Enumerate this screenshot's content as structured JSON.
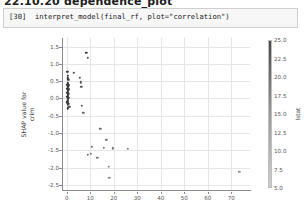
{
  "notebook": {
    "heading": "22.10.20  dependence_plot",
    "cell_prompt": "[30]",
    "cell_code": "interpret_model(final_rf, plot=\"correlation\")"
  },
  "colors": {
    "point_dark": "#3b3b3b",
    "point_mid": "#6e6e6e",
    "point_light": "#a8a8a8",
    "grid": "#e6e6e6",
    "spine": "#8a8a8a",
    "cell_bg": "#f7f7f7",
    "cell_border": "#cfcfcf"
  },
  "chart_data": {
    "type": "scatter",
    "title": "",
    "xlabel": "",
    "ylabel": "SHAP value for\ncrim",
    "ylabel_line1": "SHAP value for",
    "ylabel_line2": "crim",
    "xlim": [
      -2,
      78
    ],
    "ylim": [
      -2.65,
      1.75
    ],
    "grid": true,
    "legend": "none",
    "xticks": [
      0,
      10,
      20,
      30,
      40,
      50,
      60,
      70
    ],
    "xticklabels": [
      "0",
      "10",
      "20",
      "30",
      "40",
      "50",
      "60",
      "70"
    ],
    "yticks": [
      1.5,
      1.0,
      0.5,
      0.0,
      -0.5,
      -1.0,
      -1.5,
      -2.0,
      -2.5
    ],
    "yticklabels": [
      "1.5",
      "1.0",
      "0.5",
      "0.0",
      "-0.5",
      "-1.0",
      "-1.5",
      "-2.0",
      "-2.5"
    ],
    "colorbar": {
      "label": "lstat",
      "ticks": [
        25.0,
        22.5,
        20.0,
        17.5,
        15.0,
        12.5,
        10.0,
        7.5,
        5.0
      ],
      "ticklabels": [
        "25.0",
        "22.5",
        "20.0",
        "17.5",
        "15.0",
        "12.5",
        "10.0",
        "7.5",
        "5.0"
      ],
      "vmin": 5.0,
      "vmax": 25.0,
      "cmap": "grayscale"
    },
    "points": [
      {
        "x": 8.3,
        "y": 1.33,
        "c": 9.0
      },
      {
        "x": 8.9,
        "y": 1.18,
        "c": 10.5
      },
      {
        "x": 0.3,
        "y": 0.78,
        "c": 7.0
      },
      {
        "x": 3.1,
        "y": 0.74,
        "c": 8.5
      },
      {
        "x": 0.5,
        "y": 0.66,
        "c": 6.0
      },
      {
        "x": 5.6,
        "y": 0.6,
        "c": 11.0
      },
      {
        "x": 0.4,
        "y": 0.58,
        "c": 6.5
      },
      {
        "x": 0.6,
        "y": 0.54,
        "c": 7.5
      },
      {
        "x": 5.9,
        "y": 0.47,
        "c": 12.0
      },
      {
        "x": 0.4,
        "y": 0.46,
        "c": 6.2
      },
      {
        "x": 0.5,
        "y": 0.42,
        "c": 6.8
      },
      {
        "x": 0.3,
        "y": 0.4,
        "c": 7.2
      },
      {
        "x": 0.6,
        "y": 0.38,
        "c": 8.0
      },
      {
        "x": 0.4,
        "y": 0.35,
        "c": 6.4
      },
      {
        "x": 6.2,
        "y": 0.33,
        "c": 13.0
      },
      {
        "x": 0.5,
        "y": 0.31,
        "c": 7.8
      },
      {
        "x": 0.3,
        "y": 0.28,
        "c": 6.1
      },
      {
        "x": 0.7,
        "y": 0.26,
        "c": 8.3
      },
      {
        "x": 0.4,
        "y": 0.23,
        "c": 6.9
      },
      {
        "x": 0.5,
        "y": 0.2,
        "c": 7.4
      },
      {
        "x": 0.3,
        "y": 0.17,
        "c": 6.3
      },
      {
        "x": 0.6,
        "y": 0.14,
        "c": 8.8
      },
      {
        "x": 0.4,
        "y": 0.11,
        "c": 7.1
      },
      {
        "x": 0.5,
        "y": 0.07,
        "c": 7.6
      },
      {
        "x": 0.3,
        "y": 0.04,
        "c": 6.6
      },
      {
        "x": 0.6,
        "y": 0.01,
        "c": 8.1
      },
      {
        "x": 0.4,
        "y": -0.03,
        "c": 7.3
      },
      {
        "x": 0.5,
        "y": -0.07,
        "c": 7.9
      },
      {
        "x": 0.3,
        "y": -0.11,
        "c": 6.7
      },
      {
        "x": 0.7,
        "y": -0.15,
        "c": 9.2
      },
      {
        "x": 0.4,
        "y": -0.19,
        "c": 7.7
      },
      {
        "x": 1.1,
        "y": -0.24,
        "c": 9.6
      },
      {
        "x": 6.4,
        "y": -0.22,
        "c": 14.0
      },
      {
        "x": 0.5,
        "y": -0.29,
        "c": 8.4
      },
      {
        "x": 7.0,
        "y": -0.42,
        "c": 15.5
      },
      {
        "x": 14.3,
        "y": -0.88,
        "c": 17.0
      },
      {
        "x": 16.8,
        "y": -1.19,
        "c": 18.0
      },
      {
        "x": 10.6,
        "y": -1.4,
        "c": 16.5
      },
      {
        "x": 15.7,
        "y": -1.42,
        "c": 19.0
      },
      {
        "x": 19.5,
        "y": -1.44,
        "c": 20.0
      },
      {
        "x": 25.9,
        "y": -1.46,
        "c": 21.0
      },
      {
        "x": 9.0,
        "y": -1.63,
        "c": 17.5
      },
      {
        "x": 10.2,
        "y": -1.6,
        "c": 18.5
      },
      {
        "x": 13.1,
        "y": -1.72,
        "c": 20.5
      },
      {
        "x": 17.9,
        "y": -1.98,
        "c": 22.0
      },
      {
        "x": 18.2,
        "y": -2.3,
        "c": 23.5
      },
      {
        "x": 73.4,
        "y": -2.12,
        "c": 24.5
      }
    ]
  }
}
